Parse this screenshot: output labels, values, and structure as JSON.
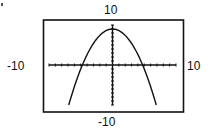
{
  "chart_data": {
    "type": "line",
    "title": "",
    "xlabel": "",
    "ylabel": "",
    "xlim": [
      -10,
      10
    ],
    "ylim": [
      -10,
      10
    ],
    "window_labels": {
      "xmin": "-10",
      "xmax": "10",
      "ymin": "-10",
      "ymax": "10"
    },
    "grid": false,
    "legend": null,
    "tick_spacing": 1,
    "series": [
      {
        "name": "parabola",
        "equation_estimate": "y = 9 - 0.4x^2",
        "x": [
          -6.9,
          -6,
          -5,
          -4.74,
          -4,
          -3,
          -2,
          -1,
          0,
          1,
          2,
          3,
          4,
          4.74,
          5,
          6,
          6.9
        ],
        "y": [
          -10,
          -5.4,
          -1,
          0,
          2.6,
          5.4,
          7.4,
          8.6,
          9,
          8.6,
          7.4,
          5.4,
          2.6,
          0,
          -1,
          -5.4,
          -10
        ]
      }
    ],
    "annotations": [
      "vertex near (0, 9)",
      "x-intercepts near x = ±4.7"
    ]
  },
  "labels": {
    "top": "10",
    "bottom": "-10",
    "left": "-10",
    "right": "10"
  },
  "colors": {
    "background": "#ffffff",
    "ink": "#111111"
  }
}
